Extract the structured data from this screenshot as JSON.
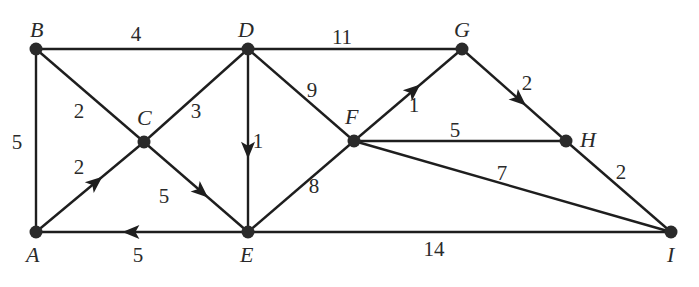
{
  "diagram": {
    "type": "weighted-directed-graph",
    "nodes": [
      {
        "id": "A",
        "label": "A",
        "x": 36,
        "y": 232,
        "lx": 26,
        "ly": 262
      },
      {
        "id": "B",
        "label": "B",
        "x": 36,
        "y": 49,
        "lx": 30,
        "ly": 37
      },
      {
        "id": "C",
        "label": "C",
        "x": 144,
        "y": 142,
        "lx": 137,
        "ly": 125
      },
      {
        "id": "D",
        "label": "D",
        "x": 248,
        "y": 49,
        "lx": 238,
        "ly": 37
      },
      {
        "id": "E",
        "label": "E",
        "x": 248,
        "y": 232,
        "lx": 240,
        "ly": 262
      },
      {
        "id": "F",
        "label": "F",
        "x": 354,
        "y": 141,
        "lx": 345,
        "ly": 124
      },
      {
        "id": "G",
        "label": "G",
        "x": 462,
        "y": 49,
        "lx": 454,
        "ly": 37
      },
      {
        "id": "H",
        "label": "H",
        "x": 566,
        "y": 141,
        "lx": 580,
        "ly": 147
      },
      {
        "id": "I",
        "label": "I",
        "x": 671,
        "y": 232,
        "lx": 667,
        "ly": 262
      }
    ],
    "edges": [
      {
        "from": "A",
        "to": "B",
        "weight": "5",
        "directed": false,
        "wx": 17,
        "wy": 149
      },
      {
        "from": "B",
        "to": "D",
        "weight": "4",
        "directed": false,
        "wx": 136,
        "wy": 41
      },
      {
        "from": "B",
        "to": "C",
        "weight": "2",
        "directed": false,
        "wx": 79,
        "wy": 118
      },
      {
        "from": "A",
        "to": "C",
        "weight": "2",
        "directed": true,
        "wx": 79,
        "wy": 174
      },
      {
        "from": "D",
        "to": "C",
        "weight": "3",
        "directed": false,
        "wx": 196,
        "wy": 118
      },
      {
        "from": "C",
        "to": "E",
        "weight": "5",
        "directed": true,
        "wx": 164,
        "wy": 203
      },
      {
        "from": "D",
        "to": "E",
        "weight": "1",
        "directed": true,
        "wx": 258,
        "wy": 148
      },
      {
        "from": "E",
        "to": "A",
        "weight": "5",
        "directed": true,
        "wx": 138,
        "wy": 262
      },
      {
        "from": "D",
        "to": "G",
        "weight": "11",
        "directed": false,
        "wx": 342,
        "wy": 44
      },
      {
        "from": "D",
        "to": "F",
        "weight": "9",
        "directed": false,
        "wx": 312,
        "wy": 97
      },
      {
        "from": "E",
        "to": "F",
        "weight": "8",
        "directed": false,
        "wx": 314,
        "wy": 193
      },
      {
        "from": "F",
        "to": "G",
        "weight": "1",
        "directed": true,
        "wx": 414,
        "wy": 112
      },
      {
        "from": "F",
        "to": "H",
        "weight": "5",
        "directed": false,
        "wx": 455,
        "wy": 137
      },
      {
        "from": "F",
        "to": "I",
        "weight": "7",
        "directed": false,
        "wx": 502,
        "wy": 180
      },
      {
        "from": "G",
        "to": "H",
        "weight": "2",
        "directed": true,
        "wx": 527,
        "wy": 90
      },
      {
        "from": "H",
        "to": "I",
        "weight": "2",
        "directed": false,
        "wx": 621,
        "wy": 179
      },
      {
        "from": "E",
        "to": "I",
        "weight": "14",
        "directed": false,
        "wx": 434,
        "wy": 256
      }
    ]
  }
}
